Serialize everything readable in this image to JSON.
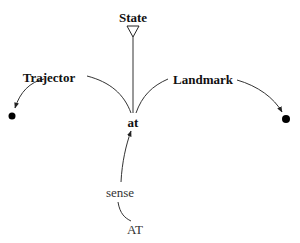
{
  "diagram": {
    "nodes": {
      "state": {
        "label": "State",
        "x": 133,
        "y": 17
      },
      "at": {
        "label": "at",
        "x": 133,
        "y": 122
      },
      "trajector": {
        "label": "Trajector",
        "x": 49,
        "y": 77
      },
      "landmark": {
        "label": "Landmark",
        "x": 195,
        "y": 79
      },
      "sense": {
        "label": "sense",
        "x": 120,
        "y": 192
      },
      "at_upper": {
        "label": "AT",
        "x": 134,
        "y": 229
      }
    },
    "edges": [
      {
        "from": "at",
        "to": "state",
        "type": "triangle-head"
      },
      {
        "from": "at",
        "to": "trajector-dot",
        "via": "Trajector",
        "type": "arrow"
      },
      {
        "from": "at",
        "to": "landmark-dot",
        "via": "Landmark",
        "type": "arrow"
      },
      {
        "from": "AT",
        "to": "at",
        "via": "sense",
        "type": "arrow"
      }
    ],
    "colors": {
      "line": "#333333",
      "text": "#111111",
      "dot": "#000000"
    }
  }
}
